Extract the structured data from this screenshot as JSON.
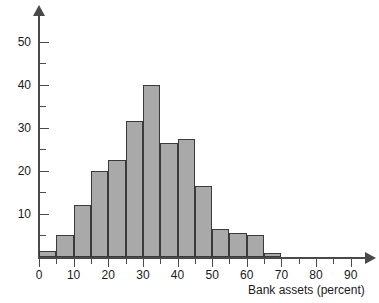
{
  "chart_data": {
    "type": "bar",
    "title": "",
    "subtitle": "",
    "xlabel": "Bank assets (percent)",
    "ylabel": "",
    "bin_width": 5,
    "bin_starts": [
      0,
      5,
      10,
      15,
      20,
      25,
      30,
      35,
      40,
      45,
      50,
      55,
      60,
      65
    ],
    "categories": [
      "0-5",
      "5-10",
      "10-15",
      "15-20",
      "20-25",
      "25-30",
      "30-35",
      "35-40",
      "40-45",
      "45-50",
      "50-55",
      "55-60",
      "60-65",
      "65-70"
    ],
    "values": [
      1.5,
      5,
      12,
      20,
      22.5,
      31.5,
      40,
      26.5,
      27.5,
      16.5,
      6.5,
      5.5,
      5,
      1
    ],
    "xlim": [
      0,
      95
    ],
    "ylim": [
      0,
      55
    ],
    "x_major_ticks": [
      0,
      10,
      20,
      30,
      40,
      50,
      60,
      70,
      80,
      90
    ],
    "x_minor_ticks": [
      5,
      15,
      25,
      35,
      45,
      55,
      65,
      75,
      85
    ],
    "x_tick_labels": [
      "0",
      "10",
      "20",
      "30",
      "40",
      "50",
      "60",
      "70",
      "80",
      "90"
    ],
    "y_major_ticks": [
      10,
      20,
      30,
      40,
      50
    ],
    "y_minor_ticks": [
      5,
      15,
      25,
      35,
      45
    ],
    "y_tick_labels": [
      "10",
      "20",
      "30",
      "40",
      "50"
    ],
    "grid": false,
    "legend": null,
    "bar_fill_color": "#a9a9a9",
    "bar_edge_color": "#3a3a3a",
    "axis_color": "#4a4a4a",
    "text_color": "#1a1a1a"
  }
}
